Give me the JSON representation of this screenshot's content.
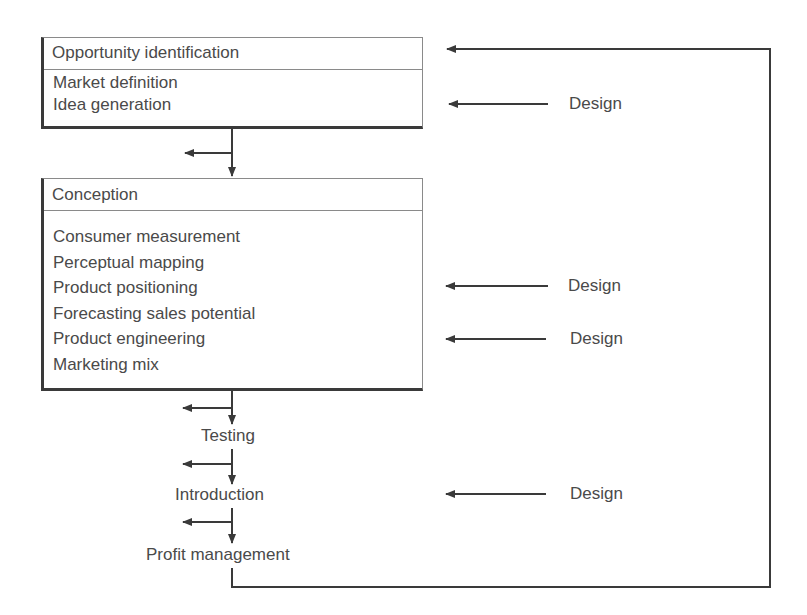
{
  "diagram": {
    "stages": [
      {
        "title": "Opportunity identification",
        "items": [
          "Market definition",
          "Idea generation"
        ]
      },
      {
        "title": "Conception",
        "items": [
          "Consumer measurement",
          "Perceptual mapping",
          "Product positioning",
          "Forecasting sales potential",
          "Product engineering",
          "Marketing mix"
        ]
      },
      {
        "title": "Testing"
      },
      {
        "title": "Introduction"
      },
      {
        "title": "Profit management"
      }
    ],
    "design_labels": [
      "Design",
      "Design",
      "Design",
      "Design"
    ],
    "line_color": "#3a3a3a",
    "text_color": "#4a4a4a"
  }
}
